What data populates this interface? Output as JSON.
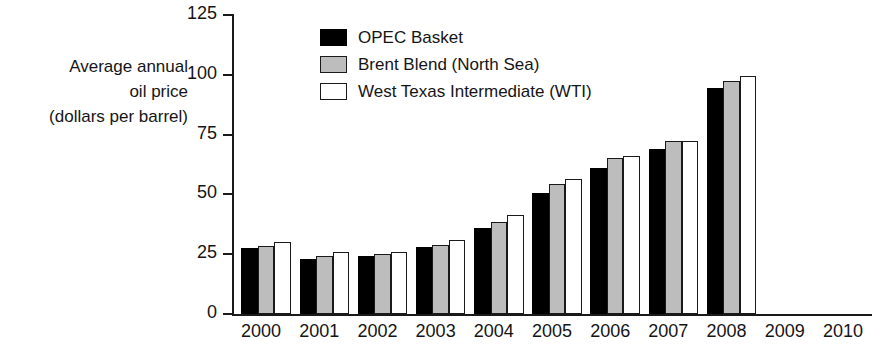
{
  "chart_data": {
    "type": "bar",
    "title": "",
    "subtitle": "",
    "xlabel": "",
    "ylabel_lines": [
      "Average annual",
      "oil price",
      "(dollars per barrel)"
    ],
    "categories": [
      "2000",
      "2001",
      "2002",
      "2003",
      "2004",
      "2005",
      "2006",
      "2007",
      "2008",
      "2009",
      "2010"
    ],
    "series": [
      {
        "name": "OPEC Basket",
        "color": "#000000",
        "values": [
          27.6,
          23.1,
          24.4,
          28.1,
          36.0,
          50.6,
          61.1,
          69.1,
          94.5,
          null,
          null
        ]
      },
      {
        "name": "Brent Blend (North Sea)",
        "color": "#bdbdbd",
        "values": [
          28.4,
          24.4,
          25.0,
          28.8,
          38.3,
          54.4,
          65.2,
          72.5,
          97.3,
          null,
          null
        ]
      },
      {
        "name": "West Texas Intermediate (WTI)",
        "color": "#ffffff",
        "values": [
          30.3,
          25.9,
          26.1,
          31.1,
          41.5,
          56.6,
          66.1,
          72.4,
          99.7,
          null,
          null
        ]
      }
    ],
    "ylim": [
      0,
      125
    ],
    "yticks": [
      0,
      25,
      50,
      75,
      100,
      125
    ],
    "ytick_labels": [
      "0",
      "25",
      "50",
      "75",
      "100",
      "125"
    ],
    "grid": false,
    "legend_position": "top-center",
    "axis_color": "#1a1a1a",
    "background": "#ffffff"
  }
}
